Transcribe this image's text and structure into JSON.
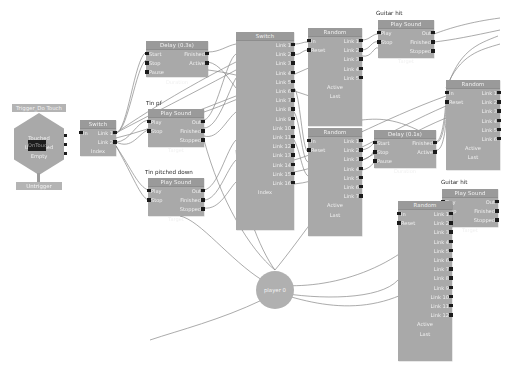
{
  "graph": {
    "title": "node-graph",
    "colors": {
      "node_body": "#a9a9a9",
      "node_title": "#9a9a9a",
      "pin": "#1b1b1b",
      "wire": "#808080",
      "background": "#ffffff",
      "annotation_text": "#2a2a2a"
    },
    "annotations": [
      {
        "id": "a-tin-pf",
        "text": "Tin pf",
        "x": 146,
        "y": 103
      },
      {
        "id": "a-tin-pitched-down",
        "text": "Tin pitched down",
        "x": 145,
        "y": 171
      },
      {
        "id": "a-guitar-hit-top",
        "text": "Guitar hit",
        "x": 376,
        "y": 12
      },
      {
        "id": "a-guitar-hit-bottom",
        "text": "Guitar hit",
        "x": 440,
        "y": 181
      }
    ],
    "trigger": {
      "tag_top": "Trigger_Do Touch",
      "tag_bottom": "Untrigger",
      "center_label": "OnTouch",
      "outputs": [
        "Touched",
        "UnTouched",
        "Empty"
      ]
    },
    "player": {
      "label": "player 0"
    },
    "nodes": [
      {
        "id": "switch-left",
        "title": "Switch",
        "x": 80,
        "y": 120,
        "w": 36,
        "h": 36,
        "inputs": [
          "In"
        ],
        "outputs": [
          "Link 1",
          "Link 2"
        ],
        "footer": "Index"
      },
      {
        "id": "delay-03",
        "title": "Delay (0.3s)",
        "x": 146,
        "y": 41,
        "w": 62,
        "h": 36,
        "inputs": [
          "Start",
          "Stop",
          "Pause"
        ],
        "outputs": [
          "Finished",
          "Active"
        ],
        "footer": "Duration"
      },
      {
        "id": "playsound-tin-pf",
        "title": "Play Sound",
        "x": 148,
        "y": 109,
        "w": 56,
        "h": 38,
        "inputs": [
          "Play",
          "Stop"
        ],
        "outputs": [
          "Out",
          "Finished",
          "Stopped"
        ],
        "footer": "Target"
      },
      {
        "id": "playsound-tin-pitched",
        "title": "Play Sound",
        "x": 148,
        "y": 178,
        "w": 56,
        "h": 38,
        "inputs": [
          "Play",
          "Stop"
        ],
        "outputs": [
          "Out",
          "Finished",
          "Stopped"
        ],
        "footer": "Target"
      },
      {
        "id": "switch-big",
        "title": "Switch",
        "x": 236,
        "y": 32,
        "w": 58,
        "h": 198,
        "inputs": [],
        "outputs": [
          "Link 1",
          "Link 2",
          "Link 3",
          "Link 4",
          "Link 5",
          "Link 6",
          "Link 7",
          "Link 8",
          "Link 9",
          "Link 10",
          "Link 11",
          "Link 12",
          "Link 13",
          "Link 14",
          "Link 15",
          "Link 16"
        ],
        "footer": "Index"
      },
      {
        "id": "random-top",
        "title": "Random",
        "x": 308,
        "y": 28,
        "w": 54,
        "h": 98,
        "inputs": [
          "In",
          "Reset"
        ],
        "outputs": [
          "Link 1",
          "Link 2",
          "Link 3",
          "Link 4",
          "Link 5"
        ],
        "footer_lines": [
          "Active",
          "Last"
        ]
      },
      {
        "id": "random-mid",
        "title": "Random",
        "x": 308,
        "y": 128,
        "w": 54,
        "h": 108,
        "inputs": [
          "In",
          "Reset"
        ],
        "outputs": [
          "Link 1",
          "Link 2",
          "Link 3",
          "Link 4",
          "Link 5",
          "Link 6",
          "Link 7"
        ],
        "footer_lines": [
          "Active",
          "Last"
        ]
      },
      {
        "id": "playsound-guitar-top",
        "title": "Play Sound",
        "x": 378,
        "y": 20,
        "w": 56,
        "h": 38,
        "inputs": [
          "Play",
          "Stop"
        ],
        "outputs": [
          "Out",
          "Finished",
          "Stopped"
        ],
        "footer": "Target"
      },
      {
        "id": "delay-01",
        "title": "Delay (0.1s)",
        "x": 374,
        "y": 130,
        "w": 62,
        "h": 38,
        "inputs": [
          "Start",
          "Stop",
          "Pause"
        ],
        "outputs": [
          "Finished",
          "Active"
        ],
        "footer": "Duration"
      },
      {
        "id": "random-right",
        "title": "Random",
        "x": 446,
        "y": 80,
        "w": 54,
        "h": 90,
        "inputs": [
          "In",
          "Reset"
        ],
        "outputs": [
          "Link 1",
          "Link 2",
          "Link 3",
          "Link 4",
          "Link 5",
          "Link 6"
        ],
        "footer_lines": [
          "Active",
          "Last"
        ]
      },
      {
        "id": "playsound-guitar-bottom",
        "title": "Play Sound",
        "x": 442,
        "y": 189,
        "w": 56,
        "h": 38,
        "inputs": [
          "Play",
          "Stop"
        ],
        "outputs": [
          "Out",
          "Finished",
          "Stopped"
        ],
        "footer": "Target"
      },
      {
        "id": "random-bottom",
        "title": "Random",
        "x": 398,
        "y": 201,
        "w": 54,
        "h": 160,
        "inputs": [
          "In",
          "Reset"
        ],
        "outputs": [
          "Link 1",
          "Link 2",
          "Link 3",
          "Link 4",
          "Link 5",
          "Link 6",
          "Link 7",
          "Link 8",
          "Link 9",
          "Link 10",
          "Link 11",
          "Link 12"
        ],
        "footer_lines": [
          "Active",
          "Last"
        ]
      }
    ]
  }
}
